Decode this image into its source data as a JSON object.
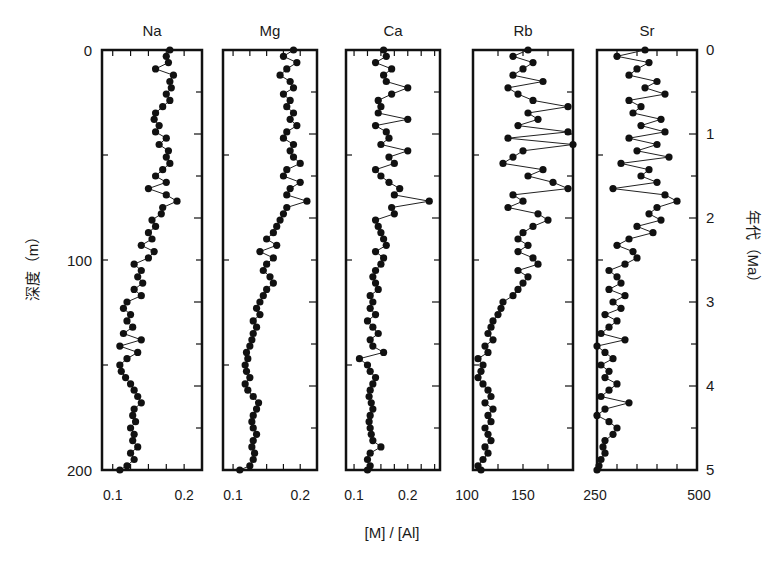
{
  "chart_data": {
    "type": "line",
    "title": "",
    "xlabel": "[M] / [Al]",
    "ylabel": "深度（m）",
    "ylabel_right": "年代（Ma）",
    "y_left": {
      "label": "深度（m）",
      "range": [
        0,
        200
      ],
      "ticks": [
        0,
        100,
        200
      ],
      "inverted": true
    },
    "y_right": {
      "label": "年代（Ma）",
      "range": [
        0,
        5
      ],
      "ticks": [
        0,
        1,
        2,
        3,
        4,
        5
      ],
      "inverted": true
    },
    "grid": false,
    "legend": null,
    "marker": "filled-circle",
    "panels": [
      {
        "name": "Na",
        "xlim": [
          0.085,
          0.225
        ],
        "xticks": [
          0.1,
          0.2
        ],
        "depth": [
          0,
          3,
          6,
          9,
          12,
          15,
          18,
          21,
          24,
          27,
          30,
          33,
          36,
          39,
          42,
          45,
          48,
          51,
          54,
          57,
          60,
          63,
          66,
          69,
          72,
          75,
          78,
          81,
          84,
          87,
          90,
          93,
          96,
          99,
          102,
          105,
          108,
          111,
          114,
          117,
          120,
          123,
          126,
          129,
          132,
          135,
          138,
          141,
          144,
          147,
          150,
          153,
          156,
          159,
          162,
          165,
          168,
          171,
          174,
          177,
          180,
          183,
          186,
          189,
          192,
          195,
          198,
          200
        ],
        "values": [
          0.18,
          0.175,
          0.178,
          0.16,
          0.185,
          0.18,
          0.182,
          0.175,
          0.18,
          0.17,
          0.16,
          0.158,
          0.165,
          0.16,
          0.175,
          0.165,
          0.178,
          0.175,
          0.18,
          0.17,
          0.16,
          0.175,
          0.15,
          0.175,
          0.19,
          0.17,
          0.168,
          0.155,
          0.16,
          0.15,
          0.155,
          0.14,
          0.158,
          0.15,
          0.13,
          0.14,
          0.135,
          0.142,
          0.13,
          0.14,
          0.12,
          0.115,
          0.125,
          0.12,
          0.128,
          0.115,
          0.14,
          0.11,
          0.135,
          0.12,
          0.11,
          0.112,
          0.118,
          0.125,
          0.13,
          0.135,
          0.14,
          0.13,
          0.128,
          0.132,
          0.125,
          0.13,
          0.128,
          0.135,
          0.125,
          0.13,
          0.12,
          0.11
        ]
      },
      {
        "name": "Mg",
        "xlim": [
          0.085,
          0.225
        ],
        "xticks": [
          0.1,
          0.2
        ],
        "depth": [
          0,
          3,
          6,
          9,
          12,
          15,
          18,
          21,
          24,
          27,
          30,
          33,
          36,
          39,
          42,
          45,
          48,
          51,
          54,
          57,
          60,
          63,
          66,
          69,
          72,
          75,
          78,
          81,
          84,
          87,
          90,
          93,
          96,
          99,
          102,
          105,
          108,
          111,
          114,
          117,
          120,
          123,
          126,
          129,
          132,
          135,
          138,
          141,
          144,
          147,
          150,
          153,
          156,
          159,
          162,
          165,
          168,
          171,
          174,
          177,
          180,
          183,
          186,
          189,
          192,
          195,
          198,
          200
        ],
        "values": [
          0.19,
          0.175,
          0.195,
          0.18,
          0.17,
          0.185,
          0.19,
          0.175,
          0.185,
          0.18,
          0.19,
          0.185,
          0.195,
          0.18,
          0.175,
          0.19,
          0.185,
          0.19,
          0.2,
          0.18,
          0.175,
          0.2,
          0.185,
          0.18,
          0.21,
          0.18,
          0.175,
          0.17,
          0.165,
          0.16,
          0.15,
          0.165,
          0.14,
          0.16,
          0.15,
          0.145,
          0.155,
          0.16,
          0.15,
          0.145,
          0.14,
          0.135,
          0.14,
          0.13,
          0.135,
          0.13,
          0.128,
          0.125,
          0.12,
          0.122,
          0.118,
          0.12,
          0.125,
          0.118,
          0.122,
          0.13,
          0.138,
          0.135,
          0.13,
          0.128,
          0.13,
          0.135,
          0.13,
          0.128,
          0.132,
          0.13,
          0.125,
          0.11
        ]
      },
      {
        "name": "Ca",
        "xlim": [
          0.085,
          0.26
        ],
        "xticks": [
          0.1,
          0.2
        ],
        "depth": [
          0,
          3,
          6,
          9,
          12,
          15,
          18,
          21,
          24,
          27,
          30,
          33,
          36,
          39,
          42,
          45,
          48,
          51,
          54,
          57,
          60,
          63,
          66,
          69,
          72,
          75,
          78,
          81,
          84,
          87,
          90,
          93,
          96,
          99,
          102,
          105,
          108,
          111,
          114,
          117,
          120,
          123,
          126,
          129,
          132,
          135,
          138,
          141,
          144,
          147,
          150,
          153,
          156,
          159,
          162,
          165,
          168,
          171,
          174,
          177,
          180,
          183,
          186,
          189,
          192,
          195,
          198,
          200
        ],
        "values": [
          0.155,
          0.16,
          0.14,
          0.17,
          0.155,
          0.16,
          0.2,
          0.17,
          0.145,
          0.15,
          0.145,
          0.2,
          0.14,
          0.16,
          0.165,
          0.15,
          0.2,
          0.165,
          0.175,
          0.14,
          0.15,
          0.165,
          0.185,
          0.175,
          0.24,
          0.17,
          0.175,
          0.14,
          0.145,
          0.15,
          0.155,
          0.16,
          0.14,
          0.155,
          0.15,
          0.14,
          0.135,
          0.14,
          0.145,
          0.13,
          0.135,
          0.13,
          0.14,
          0.125,
          0.135,
          0.145,
          0.13,
          0.135,
          0.155,
          0.11,
          0.125,
          0.13,
          0.14,
          0.135,
          0.13,
          0.128,
          0.132,
          0.135,
          0.13,
          0.128,
          0.13,
          0.132,
          0.135,
          0.15,
          0.13,
          0.125,
          0.13,
          0.125
        ]
      },
      {
        "name": "Rb",
        "xlim": [
          100,
          200
        ],
        "xticks": [
          100,
          150
        ],
        "depth": [
          0,
          3,
          6,
          9,
          12,
          15,
          18,
          21,
          24,
          27,
          30,
          33,
          36,
          39,
          42,
          45,
          48,
          51,
          54,
          57,
          60,
          63,
          66,
          69,
          72,
          75,
          78,
          81,
          84,
          87,
          90,
          93,
          96,
          99,
          102,
          105,
          108,
          111,
          114,
          117,
          120,
          123,
          126,
          129,
          132,
          135,
          138,
          141,
          144,
          147,
          150,
          153,
          156,
          159,
          162,
          165,
          168,
          171,
          174,
          177,
          180,
          183,
          186,
          189,
          192,
          195,
          198,
          200
        ],
        "values": [
          155,
          140,
          160,
          150,
          140,
          170,
          135,
          145,
          160,
          195,
          155,
          165,
          145,
          195,
          135,
          200,
          150,
          140,
          130,
          170,
          155,
          180,
          195,
          140,
          150,
          135,
          165,
          175,
          160,
          150,
          145,
          155,
          145,
          160,
          165,
          145,
          155,
          150,
          145,
          140,
          130,
          128,
          125,
          120,
          118,
          115,
          120,
          112,
          115,
          105,
          110,
          108,
          105,
          110,
          115,
          118,
          112,
          120,
          115,
          118,
          112,
          115,
          118,
          112,
          115,
          110,
          105,
          108
        ]
      },
      {
        "name": "Sr",
        "xlim": [
          250,
          500
        ],
        "xticks": [
          250,
          500
        ],
        "depth": [
          0,
          3,
          6,
          9,
          12,
          15,
          18,
          21,
          24,
          27,
          30,
          33,
          36,
          39,
          42,
          45,
          48,
          51,
          54,
          57,
          60,
          63,
          66,
          69,
          72,
          75,
          78,
          81,
          84,
          87,
          90,
          93,
          96,
          99,
          102,
          105,
          108,
          111,
          114,
          117,
          120,
          123,
          126,
          129,
          132,
          135,
          138,
          141,
          144,
          147,
          150,
          153,
          156,
          159,
          162,
          165,
          168,
          171,
          174,
          177,
          180,
          183,
          186,
          189,
          192,
          195,
          198,
          200
        ],
        "values": [
          370,
          300,
          380,
          350,
          330,
          400,
          370,
          420,
          330,
          360,
          340,
          410,
          360,
          420,
          330,
          400,
          350,
          430,
          310,
          380,
          360,
          400,
          290,
          420,
          450,
          400,
          380,
          410,
          350,
          390,
          330,
          300,
          340,
          350,
          320,
          280,
          300,
          310,
          280,
          320,
          290,
          310,
          270,
          300,
          280,
          260,
          320,
          250,
          270,
          290,
          260,
          280,
          270,
          300,
          280,
          260,
          330,
          270,
          250,
          280,
          300,
          290,
          270,
          265,
          270,
          260,
          255,
          250
        ]
      }
    ]
  },
  "labels": {
    "panel_titles": [
      "Na",
      "Mg",
      "Ca",
      "Rb",
      "Sr"
    ],
    "left_axis_title": "深度（m）",
    "right_axis_title": "年代（Ma）",
    "x_axis_title": "[M] / [Al]",
    "left_ticks": [
      "0",
      "100",
      "200"
    ],
    "right_ticks": [
      "0",
      "1",
      "2",
      "3",
      "4",
      "5"
    ],
    "x_tick_labels": {
      "Na": [
        "0.1",
        "0.2"
      ],
      "Mg": [
        "0.1",
        "0.2"
      ],
      "Ca": [
        "0.1",
        "0.2"
      ],
      "Rb": [
        "100",
        "150"
      ],
      "Sr": [
        "250",
        "500"
      ]
    }
  }
}
